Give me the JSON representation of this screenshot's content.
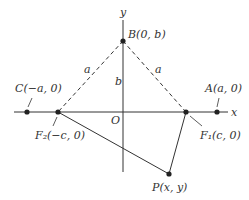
{
  "diagram": {
    "axes": {
      "x_label": "x",
      "y_label": "y",
      "origin_label": "O"
    },
    "points": {
      "B": {
        "label": "B(0, b)",
        "x": 123,
        "y": 41
      },
      "C": {
        "label": "C(−a, 0)",
        "x": 27,
        "y": 112
      },
      "A": {
        "label": "A(a, 0)",
        "x": 217,
        "y": 112
      },
      "F2": {
        "label": "F₂(−c, 0)",
        "x": 58,
        "y": 112
      },
      "F1": {
        "label": "F₁(c, 0)",
        "x": 186,
        "y": 112
      },
      "P": {
        "label": "P(x, y)",
        "x": 169,
        "y": 174
      }
    },
    "segment_labels": {
      "left_dashed": "a",
      "right_dashed": "a",
      "vertical": "b"
    },
    "colors": {
      "line": "#333333",
      "background": "#ffffff"
    }
  }
}
